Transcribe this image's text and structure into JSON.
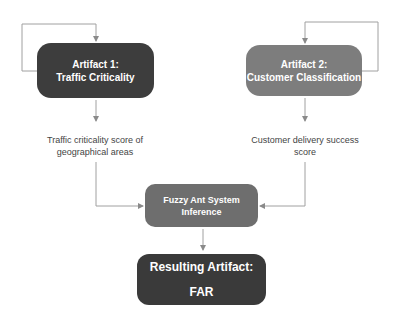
{
  "diagram": {
    "nodes": {
      "artifact1": {
        "line1": "Artifact 1:",
        "line2": "Traffic Criticality",
        "color": "#3d3d3d"
      },
      "artifact2": {
        "line1": "Artifact 2:",
        "line2": "Customer Classification",
        "color": "#7d7d7d"
      },
      "inference": {
        "line1": "Fuzzy Ant System",
        "line2": "Inference",
        "color": "#6e6e6e"
      },
      "result": {
        "line1": "Resulting Artifact:",
        "line2": "FAR",
        "color": "#3a3a3a"
      }
    },
    "labels": {
      "output1": {
        "line1": "Traffic criticality score of",
        "line2": "geographical areas"
      },
      "output2": {
        "line1": "Customer delivery success",
        "line2": "score"
      }
    },
    "edges": [
      {
        "from": "artifact1",
        "to": "artifact1",
        "type": "feedback-loop"
      },
      {
        "from": "artifact2",
        "to": "artifact2",
        "type": "feedback-loop"
      },
      {
        "from": "artifact1",
        "to": "output1"
      },
      {
        "from": "artifact2",
        "to": "output2"
      },
      {
        "from": "output1",
        "to": "inference"
      },
      {
        "from": "output2",
        "to": "inference"
      },
      {
        "from": "inference",
        "to": "result"
      }
    ],
    "line_color": "#9a9a9a"
  }
}
